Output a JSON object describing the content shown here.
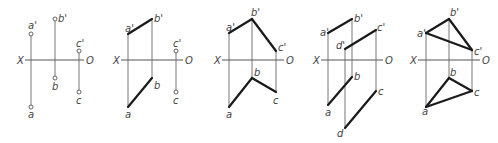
{
  "figure": {
    "colors": {
      "background": "#ffffff",
      "thin_line": "#666666",
      "thick_line": "#1a1a1a",
      "text": "#444444"
    },
    "panels": [
      {
        "id": "panel-1",
        "axis": {
          "y": 60,
          "x1": 25,
          "x2": 84,
          "label_left": "X",
          "label_left_x": 17,
          "label_right": "O",
          "label_right_x": 86
        },
        "points": [
          {
            "name": "a'",
            "x": 31,
            "y": 34,
            "circle": true,
            "lx": 28,
            "ly": 29
          },
          {
            "name": "b'",
            "x": 55,
            "y": 19,
            "circle": true,
            "lx": 58,
            "ly": 22
          },
          {
            "name": "c'",
            "x": 79,
            "y": 51,
            "circle": true,
            "lx": 76,
            "ly": 47
          },
          {
            "name": "a",
            "x": 31,
            "y": 107,
            "circle": true,
            "lx": 28,
            "ly": 118
          },
          {
            "name": "b",
            "x": 55,
            "y": 78,
            "circle": true,
            "lx": 52,
            "ly": 90
          },
          {
            "name": "c",
            "x": 79,
            "y": 92,
            "circle": true,
            "lx": 76,
            "ly": 104
          }
        ],
        "projectors": [
          [
            "a'",
            "a"
          ],
          [
            "b'",
            "b"
          ],
          [
            "c'",
            "c"
          ]
        ],
        "edges": []
      },
      {
        "id": "panel-2",
        "axis": {
          "y": 60,
          "x1": 121,
          "x2": 183,
          "label_left": "X",
          "label_left_x": 113,
          "label_right": "O",
          "label_right_x": 185
        },
        "points": [
          {
            "name": "a'",
            "x": 128,
            "y": 34,
            "circle": false,
            "lx": 125,
            "ly": 32
          },
          {
            "name": "b'",
            "x": 152,
            "y": 19,
            "circle": false,
            "lx": 154,
            "ly": 22
          },
          {
            "name": "c'",
            "x": 176,
            "y": 51,
            "circle": true,
            "lx": 173,
            "ly": 47
          },
          {
            "name": "a",
            "x": 128,
            "y": 107,
            "circle": false,
            "lx": 125,
            "ly": 118
          },
          {
            "name": "b",
            "x": 152,
            "y": 78,
            "circle": false,
            "lx": 154,
            "ly": 89
          },
          {
            "name": "c",
            "x": 176,
            "y": 92,
            "circle": true,
            "lx": 173,
            "ly": 104
          }
        ],
        "projectors": [
          [
            "a'",
            "a"
          ],
          [
            "b'",
            "b"
          ],
          [
            "c'",
            "c"
          ]
        ],
        "edges": [
          [
            "a'",
            "b'"
          ],
          [
            "a",
            "b"
          ]
        ]
      },
      {
        "id": "panel-3",
        "axis": {
          "y": 60,
          "x1": 222,
          "x2": 284,
          "label_left": "X",
          "label_left_x": 214,
          "label_right": "O",
          "label_right_x": 286
        },
        "points": [
          {
            "name": "a'",
            "x": 229,
            "y": 33,
            "circle": false,
            "lx": 226,
            "ly": 31
          },
          {
            "name": "b'",
            "x": 252,
            "y": 19,
            "circle": false,
            "lx": 251,
            "ly": 16
          },
          {
            "name": "c'",
            "x": 276,
            "y": 51,
            "circle": false,
            "lx": 278,
            "ly": 51
          },
          {
            "name": "a",
            "x": 229,
            "y": 107,
            "circle": false,
            "lx": 226,
            "ly": 118
          },
          {
            "name": "b",
            "x": 252,
            "y": 78,
            "circle": false,
            "lx": 254,
            "ly": 76
          },
          {
            "name": "c",
            "x": 276,
            "y": 92,
            "circle": false,
            "lx": 273,
            "ly": 104
          }
        ],
        "projectors": [
          [
            "a'",
            "a"
          ],
          [
            "b'",
            "b"
          ],
          [
            "c'",
            "c"
          ]
        ],
        "edges": [
          [
            "a'",
            "b'"
          ],
          [
            "b'",
            "c'"
          ],
          [
            "a",
            "b"
          ],
          [
            "b",
            "c"
          ]
        ]
      },
      {
        "id": "panel-4",
        "axis": {
          "y": 60,
          "x1": 321,
          "x2": 383,
          "label_left": "X",
          "label_left_x": 313,
          "label_right": "O",
          "label_right_x": 385
        },
        "points": [
          {
            "name": "a'",
            "x": 328,
            "y": 33,
            "circle": false,
            "lx": 320,
            "ly": 36
          },
          {
            "name": "b'",
            "x": 352,
            "y": 19,
            "circle": false,
            "lx": 354,
            "ly": 22
          },
          {
            "name": "c'",
            "x": 376,
            "y": 30,
            "circle": false,
            "lx": 377,
            "ly": 31
          },
          {
            "name": "d'",
            "x": 345,
            "y": 49,
            "circle": false,
            "lx": 336,
            "ly": 49
          },
          {
            "name": "a",
            "x": 328,
            "y": 105,
            "circle": false,
            "lx": 325,
            "ly": 116
          },
          {
            "name": "b",
            "x": 352,
            "y": 77,
            "circle": false,
            "lx": 354,
            "ly": 80
          },
          {
            "name": "c",
            "x": 376,
            "y": 91,
            "circle": false,
            "lx": 378,
            "ly": 95
          },
          {
            "name": "d",
            "x": 345,
            "y": 128,
            "circle": false,
            "lx": 337,
            "ly": 137
          }
        ],
        "projectors": [
          [
            "a'",
            "a"
          ],
          [
            "b'",
            "b"
          ],
          [
            "c'",
            "c"
          ],
          [
            "d'",
            "d"
          ]
        ],
        "edges": [
          [
            "a'",
            "b'"
          ],
          [
            "d'",
            "c'"
          ],
          [
            "a",
            "b"
          ],
          [
            "d",
            "c"
          ]
        ]
      },
      {
        "id": "panel-5",
        "axis": {
          "y": 60,
          "x1": 418,
          "x2": 480,
          "label_left": "X",
          "label_left_x": 410,
          "label_right": "O",
          "label_right_x": 482
        },
        "points": [
          {
            "name": "a'",
            "x": 426,
            "y": 33,
            "circle": false,
            "lx": 417,
            "ly": 37
          },
          {
            "name": "b'",
            "x": 449,
            "y": 19,
            "circle": false,
            "lx": 450,
            "ly": 16
          },
          {
            "name": "c'",
            "x": 472,
            "y": 50,
            "circle": false,
            "lx": 474,
            "ly": 55
          },
          {
            "name": "a",
            "x": 426,
            "y": 107,
            "circle": false,
            "lx": 422,
            "ly": 115
          },
          {
            "name": "b",
            "x": 449,
            "y": 78,
            "circle": false,
            "lx": 450,
            "ly": 76
          },
          {
            "name": "c",
            "x": 472,
            "y": 91,
            "circle": false,
            "lx": 474,
            "ly": 96
          }
        ],
        "projectors": [
          [
            "a'",
            "a"
          ],
          [
            "b'",
            "b"
          ],
          [
            "c'",
            "c"
          ]
        ],
        "edges": [
          [
            "a'",
            "b'"
          ],
          [
            "b'",
            "c'"
          ],
          [
            "a'",
            "c'"
          ],
          [
            "a",
            "b"
          ],
          [
            "b",
            "c"
          ],
          [
            "a",
            "c"
          ]
        ]
      }
    ]
  }
}
